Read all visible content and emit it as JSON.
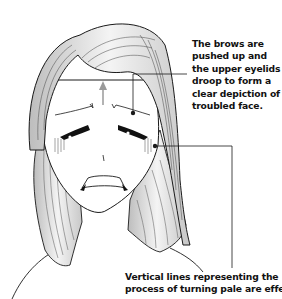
{
  "illustration": {
    "subject": "troubled-face-girl",
    "line_color": "#1a1a1a",
    "hair_shade_color": "#d8d8d8",
    "arrow_color": "#9a9a9a"
  },
  "annotations": [
    {
      "id": "brows",
      "lines": [
        "The brows are",
        "pushed up and",
        "the upper eyelids",
        "droop to form a",
        "clear depiction of a",
        "troubled face."
      ]
    },
    {
      "id": "pale",
      "lines": [
        "Vertical lines representing the",
        "process of turning pale are effective"
      ]
    }
  ]
}
